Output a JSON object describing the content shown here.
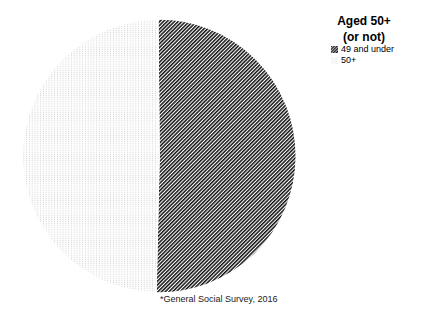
{
  "title": {
    "line1": "Aged 50+",
    "line2": "(or not)"
  },
  "legend": {
    "items": [
      {
        "label": "49 and under",
        "pattern": "diagonal-hatch"
      },
      {
        "label": "50+",
        "pattern": "light-dots"
      }
    ]
  },
  "footnote": "*General Social Survey, 2016",
  "colors": {
    "hatch_ink": "#111111",
    "dot_ink": "#d2d2d2",
    "background": "#ffffff"
  },
  "chart_data": {
    "type": "pie",
    "title": "Aged 50+ (or not)",
    "labels": [
      "49 and under",
      "50+"
    ],
    "values": [
      50.5,
      49.5
    ],
    "patterns": [
      "diagonal-hatch",
      "light-dots"
    ],
    "start_angle_deg": -0.5,
    "direction": "clockwise",
    "legend_position": "top-right",
    "footnote": "*General Social Survey, 2016"
  }
}
